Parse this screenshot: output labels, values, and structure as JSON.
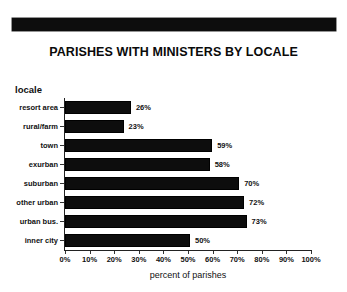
{
  "header": {
    "rule_label": "scanned-header-rule"
  },
  "chart_data": {
    "type": "bar",
    "orientation": "horizontal",
    "title": "PARISHES WITH MINISTERS BY LOCALE",
    "xlabel": "percent of parishes",
    "ylabel": "locale",
    "categories": [
      "resort area",
      "rural/farm",
      "town",
      "exurban",
      "suburban",
      "other urban",
      "urban bus.",
      "inner city"
    ],
    "values": [
      26,
      23,
      59,
      58,
      70,
      72,
      73,
      50
    ],
    "value_labels": [
      "26%",
      "23%",
      "59%",
      "58%",
      "70%",
      "72%",
      "73%",
      "50%"
    ],
    "xlim": [
      0,
      100
    ],
    "xticks": [
      0,
      10,
      20,
      30,
      40,
      50,
      60,
      70,
      80,
      90,
      100
    ],
    "xtick_labels": [
      "0%",
      "10%",
      "20%",
      "30%",
      "40%",
      "50%",
      "60%",
      "70%",
      "80%",
      "90%",
      "100%"
    ],
    "grid": false,
    "legend": false,
    "bar_color": "#0d0d0d",
    "background_color": "#ffffff"
  }
}
